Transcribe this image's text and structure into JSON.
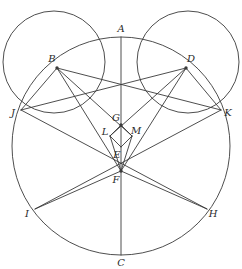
{
  "figure": {
    "width": 242,
    "height": 269,
    "background": "#ffffff",
    "stroke_color": "#3a3a3a",
    "label_color": "#2b2b2b",
    "stroke_width": 0.9
  },
  "circles": [
    {
      "name": "main-circle",
      "cx": 121,
      "cy": 146,
      "r": 109
    },
    {
      "name": "left-circle",
      "cx": 54,
      "cy": 62,
      "r": 51
    },
    {
      "name": "right-circle",
      "cx": 188,
      "cy": 62,
      "r": 51
    }
  ],
  "points": [
    {
      "id": "A",
      "label": "A",
      "x": 121,
      "y": 37,
      "lx": 121,
      "ly": 29,
      "dot": false
    },
    {
      "id": "B",
      "label": "B",
      "x": 57,
      "y": 68,
      "lx": 52,
      "ly": 59,
      "dot": true
    },
    {
      "id": "C",
      "label": "C",
      "x": 121,
      "y": 255,
      "lx": 121,
      "ly": 263,
      "dot": false
    },
    {
      "id": "D",
      "label": "D",
      "x": 186,
      "y": 68,
      "lx": 191,
      "ly": 59,
      "dot": true
    },
    {
      "id": "E",
      "label": "E",
      "x": 121,
      "y": 147,
      "lx": 117,
      "ly": 155,
      "dot": false
    },
    {
      "id": "F",
      "label": "F",
      "x": 121,
      "y": 171,
      "lx": 116,
      "ly": 180,
      "dot": true
    },
    {
      "id": "G",
      "label": "G",
      "x": 121,
      "y": 125,
      "lx": 116,
      "ly": 118,
      "dot": true
    },
    {
      "id": "H",
      "label": "H",
      "x": 207,
      "y": 209,
      "lx": 213,
      "ly": 214,
      "dot": false
    },
    {
      "id": "I",
      "label": "I",
      "x": 35,
      "y": 209,
      "lx": 27,
      "ly": 214,
      "dot": false
    },
    {
      "id": "J",
      "label": "J",
      "x": 21,
      "y": 110,
      "lx": 13,
      "ly": 113,
      "dot": false
    },
    {
      "id": "K",
      "label": "K",
      "x": 221,
      "y": 110,
      "lx": 228,
      "ly": 113,
      "dot": false
    },
    {
      "id": "L",
      "label": "L",
      "x": 110,
      "y": 136,
      "lx": 105,
      "ly": 132,
      "dot": false
    },
    {
      "id": "M",
      "label": "M",
      "x": 132,
      "y": 136,
      "lx": 136,
      "ly": 131,
      "dot": false
    }
  ],
  "segments": [
    {
      "name": "segment-A-C",
      "from": "A",
      "to": "C"
    },
    {
      "name": "segment-B-J",
      "from": "B",
      "to": "J"
    },
    {
      "name": "segment-B-F",
      "from": "B",
      "to": "F"
    },
    {
      "name": "segment-B-M",
      "from": "B",
      "to": "M"
    },
    {
      "name": "segment-B-K",
      "from": "B",
      "to": "K"
    },
    {
      "name": "segment-D-K",
      "from": "D",
      "to": "K"
    },
    {
      "name": "segment-D-F",
      "from": "D",
      "to": "F"
    },
    {
      "name": "segment-D-L",
      "from": "D",
      "to": "L"
    },
    {
      "name": "segment-D-J",
      "from": "D",
      "to": "J"
    },
    {
      "name": "segment-J-H",
      "from": "J",
      "to": "H"
    },
    {
      "name": "segment-K-I",
      "from": "K",
      "to": "I"
    },
    {
      "name": "segment-I-F",
      "from": "I",
      "to": "F"
    },
    {
      "name": "segment-H-F",
      "from": "H",
      "to": "F"
    },
    {
      "name": "segment-G-L",
      "from": "G",
      "to": "L"
    },
    {
      "name": "segment-G-M",
      "from": "G",
      "to": "M"
    },
    {
      "name": "segment-L-E",
      "from": "L",
      "to": "E"
    },
    {
      "name": "segment-M-E",
      "from": "M",
      "to": "E"
    },
    {
      "name": "segment-L-F",
      "from": "L",
      "to": "F"
    },
    {
      "name": "segment-M-F",
      "from": "M",
      "to": "F"
    }
  ]
}
